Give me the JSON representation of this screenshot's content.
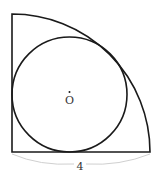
{
  "diagram": {
    "center_label": "O",
    "radius_label": "4",
    "colors": {
      "stroke": "#1a1a1a",
      "brace": "#d0d0d0",
      "text": "#333333"
    }
  }
}
